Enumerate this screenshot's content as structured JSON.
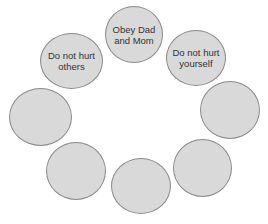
{
  "diagram": {
    "type": "circle-ring",
    "colors": {
      "fill": "#d9d9d9",
      "stroke": "#8a8a8a",
      "text": "#333333",
      "background": "#ffffff"
    },
    "nodes": [
      {
        "id": "top",
        "label": "Obey Dad\nand Mom"
      },
      {
        "id": "upper-left",
        "label": "Do not hurt\nothers"
      },
      {
        "id": "upper-right",
        "label": "Do not hurt\nyourself"
      },
      {
        "id": "left",
        "label": ""
      },
      {
        "id": "right",
        "label": ""
      },
      {
        "id": "lower-left",
        "label": ""
      },
      {
        "id": "bottom",
        "label": ""
      },
      {
        "id": "lower-right",
        "label": ""
      }
    ]
  }
}
